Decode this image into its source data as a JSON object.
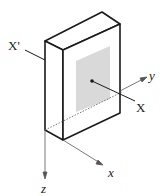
{
  "diagram": {
    "labels": {
      "x_prime": "X'",
      "x_point": "X",
      "axis_x": "x",
      "axis_y": "y",
      "axis_z": "z"
    },
    "colors": {
      "stroke": "#1a1a1a",
      "shaded_face": "#d9d9d9",
      "axis": "#555555"
    }
  }
}
